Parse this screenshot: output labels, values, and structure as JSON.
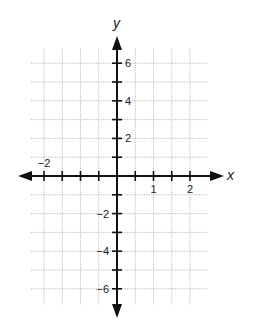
{
  "diagram": {
    "type": "coordinate-plane",
    "axes": {
      "x_label": "x",
      "y_label": "y"
    },
    "x_range": [
      -2.5,
      2.5
    ],
    "y_range": [
      -7,
      7
    ],
    "x_tick_step": 0.5,
    "y_tick_step": 1,
    "x_tick_labels": [
      {
        "value": -2,
        "text": "−2"
      },
      {
        "value": 1,
        "text": "1"
      },
      {
        "value": 2,
        "text": "2"
      }
    ],
    "y_tick_labels": [
      {
        "value": 6,
        "text": "6"
      },
      {
        "value": 4,
        "text": "4"
      },
      {
        "value": 2,
        "text": "2"
      },
      {
        "value": -2,
        "text": "−2"
      },
      {
        "value": -4,
        "text": "−4"
      },
      {
        "value": -6,
        "text": "−6"
      }
    ],
    "colors": {
      "axis": "#111111",
      "grid": "#9a9a9a",
      "background": "#ffffff"
    }
  }
}
